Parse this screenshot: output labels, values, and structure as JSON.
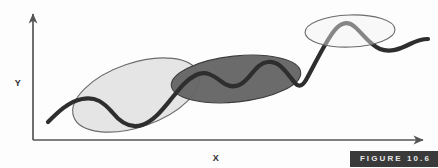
{
  "figure": {
    "caption": "FIGURE 10.6",
    "background_color": "#fdfdfd",
    "caption_background_color": "#3a3a3a",
    "caption_text_color": "#e8e8e8"
  },
  "axes": {
    "x_label": "X",
    "y_label": "Y",
    "axis_color": "#555555",
    "origin": {
      "x": 33,
      "y": 140
    },
    "x_axis_end": {
      "x": 427,
      "y": 140
    },
    "y_axis_end": {
      "x": 33,
      "y": 11
    }
  },
  "curve": {
    "name": "data-trend-curve",
    "color": "#2e2e2e",
    "stroke_width": 4.2,
    "path": "M 48 122 C 58 112, 68 102, 82 99 C 96 96, 104 103, 112 112 C 120 122, 130 129, 142 125 C 154 121, 163 109, 172 98 C 180 88, 186 80, 196 75 C 206 70, 214 76, 222 82 C 230 88, 238 88, 246 80 C 254 72, 258 63, 268 62 C 278 61, 284 69, 291 78 C 296 85, 300 90, 306 80 C 314 66, 324 44, 334 31 C 341 22, 348 21, 355 27 C 363 34, 370 45, 380 49 C 390 53, 400 49, 410 44 C 418 40, 423 39, 428 39"
  },
  "clusters": [
    {
      "name": "cluster-light-left",
      "fill": "#e3e3e3",
      "stroke": "#6b6b6b",
      "opacity": 0.92,
      "cx": 136,
      "cy": 95,
      "rx": 66,
      "ry": 32,
      "rotation": -19
    },
    {
      "name": "cluster-dark-middle",
      "fill": "#656565",
      "stroke": "#3d3d3d",
      "opacity": 0.96,
      "cx": 236,
      "cy": 79,
      "rx": 65,
      "ry": 23,
      "rotation": -6
    },
    {
      "name": "cluster-light-right",
      "fill": "#f1f1f1",
      "stroke": "#6b6b6b",
      "opacity": 0.55,
      "cx": 350,
      "cy": 31,
      "rx": 45,
      "ry": 16,
      "rotation": -2
    }
  ]
}
